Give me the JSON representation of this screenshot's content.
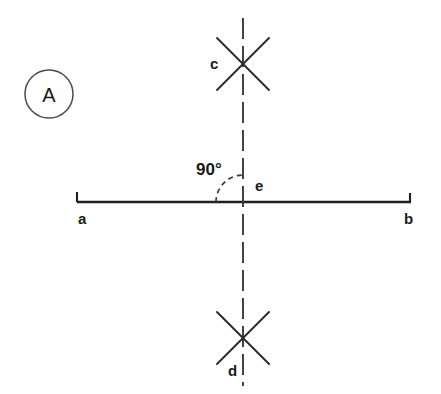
{
  "figure": {
    "panel_label": "A",
    "background_color": "#ffffff",
    "ink_color": "#1f1f1f"
  },
  "labels": {
    "point_a": "a",
    "point_b": "b",
    "point_c": "c",
    "point_d": "d",
    "point_e": "e",
    "angle": "90°"
  },
  "geometry": {
    "base_line": {
      "x1": 77,
      "y1": 202,
      "x2": 411,
      "y2": 202
    },
    "end_tick_left": {
      "x": 77,
      "y_top": 192,
      "y_bottom": 202
    },
    "end_tick_right": {
      "x": 410,
      "y_top": 193,
      "y_bottom": 202
    },
    "vertical_dashed_line": {
      "x": 243,
      "y_top": 18,
      "y_bottom": 386
    },
    "intersection_point": {
      "x": 243,
      "y": 202
    },
    "cross_upper": {
      "cx": 243,
      "cy": 64,
      "arm_dx": 26,
      "arm_dy": 26
    },
    "cross_lower": {
      "cx": 243,
      "cy": 338,
      "arm_dx": 26,
      "arm_dy": 26
    },
    "angle_arc": {
      "cx": 243,
      "cy": 202,
      "radius": 27,
      "start_deg": 180,
      "end_deg": 270
    },
    "panel_circle": {
      "cx": 49,
      "cy": 94,
      "r": 24
    }
  },
  "label_positions": {
    "point_a": {
      "x": 78,
      "y": 224
    },
    "point_b": {
      "x": 404,
      "y": 224
    },
    "point_c": {
      "x": 210,
      "y": 69
    },
    "point_d": {
      "x": 228,
      "y": 376
    },
    "point_e": {
      "x": 255,
      "y": 191
    },
    "angle": {
      "x": 196,
      "y": 175
    },
    "panel_label": {
      "x": 49,
      "y": 102
    }
  }
}
